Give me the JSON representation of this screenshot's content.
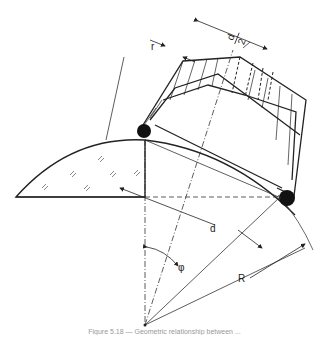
{
  "diagram": {
    "type": "technical-drawing",
    "labels": {
      "r": "r",
      "d_half_num": "d",
      "d_half_den": "2",
      "d": "d",
      "phi": "φ",
      "R": "R"
    },
    "caption": "Figure 5.18 — Geometric relationship between ..."
  }
}
